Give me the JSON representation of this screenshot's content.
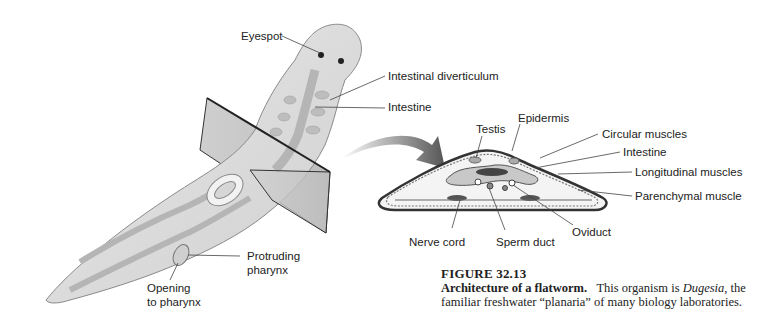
{
  "figure": {
    "number": "FIGURE 32.13",
    "title": "Architecture of a flatworm.",
    "caption_part1": "This organism is ",
    "caption_genus": "Dugesia",
    "caption_part2": ", the",
    "caption_line2": "familiar freshwater “planaria” of many biology laboratories."
  },
  "whole_worm_labels": {
    "eyespot": "Eyespot",
    "intestinal_diverticulum": "Intestinal diverticulum",
    "intestine": "Intestine",
    "protruding_pharynx_1": "Protruding",
    "protruding_pharynx_2": "pharynx",
    "opening_1": "Opening",
    "opening_2": "to pharynx"
  },
  "cross_section_labels": {
    "testis": "Testis",
    "epidermis": "Epidermis",
    "circular_muscles": "Circular muscles",
    "intestine": "Intestine",
    "longitudinal_muscles": "Longitudinal  muscles",
    "parenchymal_muscle": "Parenchymal muscle",
    "nerve_cord": "Nerve cord",
    "sperm_duct": "Sperm duct",
    "oviduct": "Oviduct"
  },
  "colors": {
    "body": "#d9d9d9",
    "gut": "#b5b5b5",
    "line": "#333333"
  }
}
